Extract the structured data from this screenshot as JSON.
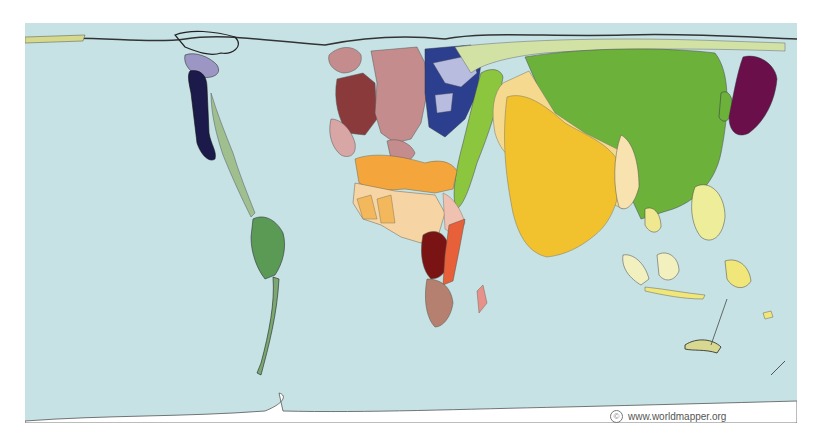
{
  "map": {
    "type": "cartogram",
    "ocean_color": "#c6e2e4",
    "regions": [
      {
        "name": "north-america-canada-alaska",
        "color": "#1c1a4a"
      },
      {
        "name": "north-america-greenland-region",
        "color": "#9c96c4"
      },
      {
        "name": "central-america",
        "color": "#9fbf8e"
      },
      {
        "name": "south-america",
        "color": "#5a9a55"
      },
      {
        "name": "western-europe",
        "color": "#8a3a3a"
      },
      {
        "name": "europe-pink",
        "color": "#c48c8c"
      },
      {
        "name": "iberia",
        "color": "#d9a6a6"
      },
      {
        "name": "eastern-europe",
        "color": "#2b3f8e"
      },
      {
        "name": "eastern-europe-light",
        "color": "#b8bde0"
      },
      {
        "name": "middle-east-central-asia",
        "color": "#8cc63f"
      },
      {
        "name": "russia-northern-band",
        "color": "#d2e2a4"
      },
      {
        "name": "china",
        "color": "#6cb13a"
      },
      {
        "name": "india",
        "color": "#f2c12e"
      },
      {
        "name": "south-asia-light",
        "color": "#f5d98f"
      },
      {
        "name": "japan",
        "color": "#6b0f4a"
      },
      {
        "name": "north-africa",
        "color": "#f4a63c"
      },
      {
        "name": "west-africa",
        "color": "#f7d4a3"
      },
      {
        "name": "central-africa",
        "color": "#7a1414"
      },
      {
        "name": "east-africa",
        "color": "#e8603a"
      },
      {
        "name": "southern-africa",
        "color": "#b58070"
      },
      {
        "name": "southeast-asia",
        "color": "#f3f0a8"
      },
      {
        "name": "philippines",
        "color": "#eeee9a"
      },
      {
        "name": "oceania",
        "color": "#f0e67a"
      }
    ]
  },
  "credit": {
    "symbol": "©",
    "text": "www.worldmapper.org"
  }
}
